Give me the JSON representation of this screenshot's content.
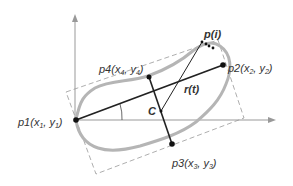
{
  "diagram": {
    "type": "geometric-shape-analysis",
    "labels": {
      "p1": {
        "name": "p1",
        "coords": "(x",
        "sub": "1",
        "mid": ", y",
        "sub2": "1",
        "end": ")"
      },
      "p2": {
        "name": "p2",
        "coords": "(x",
        "sub": "2",
        "mid": ", y",
        "sub2": "2",
        "end": ")"
      },
      "p3": {
        "name": "p3",
        "coords": "(x",
        "sub": "3",
        "mid": ", y",
        "sub2": "3",
        "end": ")"
      },
      "p4": {
        "name": "p4",
        "coords": "(x",
        "sub": "4",
        "mid": ", y",
        "sub2": "4",
        "end": ")"
      },
      "pi": "p(i)",
      "rt": "r(t)",
      "c": "C"
    },
    "colors": {
      "axis": "#999999",
      "shape": "#b8b8b8",
      "line": "#222222",
      "dash": "#888888"
    }
  }
}
